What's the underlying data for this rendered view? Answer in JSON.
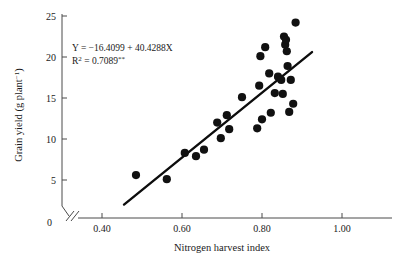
{
  "chart_data": {
    "type": "scatter",
    "title": "",
    "xlabel": "Nitrogen harvest index",
    "ylabel": "Grain yield (g plant−1)",
    "ylabel_main": "Grain yield (g plant",
    "ylabel_exponent": "−1",
    "ylabel_close": ")",
    "xlim": [
      0.4,
      1.0
    ],
    "ylim": [
      0,
      25
    ],
    "grid": false,
    "legend": "none",
    "x_axis_break": true,
    "x_origin_tick_label": "0",
    "xticks": [
      0.4,
      0.6,
      0.8,
      1.0
    ],
    "xtick_labels": [
      "0.40",
      "0.60",
      "0.80",
      "1.00"
    ],
    "yticks": [
      0,
      5,
      10,
      15,
      20,
      25
    ],
    "ytick_labels": [
      "0",
      "5",
      "10",
      "15",
      "20",
      "25"
    ],
    "annotations": {
      "equation": "Y = −16.4099 + 40.4288X",
      "r_squared_prefix": "R",
      "r_squared_exponent": "2",
      "r_squared_value": " = 0.7089",
      "r_squared_significance": "**"
    },
    "fit_line": {
      "intercept": -16.4099,
      "slope": 40.4288,
      "x_start": 0.455,
      "x_end": 0.925,
      "y_start": 2.0,
      "y_end": 20.6
    },
    "points": [
      {
        "x": 0.485,
        "y": 5.6
      },
      {
        "x": 0.562,
        "y": 5.1
      },
      {
        "x": 0.607,
        "y": 8.3
      },
      {
        "x": 0.635,
        "y": 7.9
      },
      {
        "x": 0.655,
        "y": 8.7
      },
      {
        "x": 0.688,
        "y": 12.0
      },
      {
        "x": 0.697,
        "y": 10.1
      },
      {
        "x": 0.712,
        "y": 12.9
      },
      {
        "x": 0.718,
        "y": 11.2
      },
      {
        "x": 0.75,
        "y": 15.1
      },
      {
        "x": 0.788,
        "y": 11.3
      },
      {
        "x": 0.793,
        "y": 16.5
      },
      {
        "x": 0.796,
        "y": 20.1
      },
      {
        "x": 0.8,
        "y": 12.4
      },
      {
        "x": 0.808,
        "y": 21.2
      },
      {
        "x": 0.818,
        "y": 18.0
      },
      {
        "x": 0.822,
        "y": 13.2
      },
      {
        "x": 0.832,
        "y": 15.6
      },
      {
        "x": 0.84,
        "y": 17.6
      },
      {
        "x": 0.848,
        "y": 17.2
      },
      {
        "x": 0.852,
        "y": 15.5
      },
      {
        "x": 0.855,
        "y": 22.5
      },
      {
        "x": 0.858,
        "y": 21.5
      },
      {
        "x": 0.86,
        "y": 22.1
      },
      {
        "x": 0.862,
        "y": 20.7
      },
      {
        "x": 0.864,
        "y": 18.9
      },
      {
        "x": 0.868,
        "y": 13.3
      },
      {
        "x": 0.872,
        "y": 17.2
      },
      {
        "x": 0.878,
        "y": 14.3
      },
      {
        "x": 0.884,
        "y": 24.2
      }
    ]
  }
}
